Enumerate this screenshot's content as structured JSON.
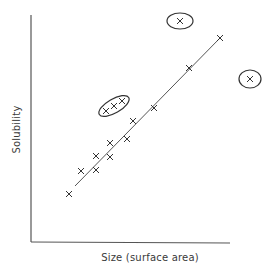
{
  "chart_data": {
    "type": "scatter",
    "title": "",
    "xlabel": "Size (surface area)",
    "ylabel": "Solubility",
    "grid": false,
    "legend": null,
    "axis_ticks": "none",
    "series": [
      {
        "name": "on-trend compounds",
        "marker": "x",
        "points": [
          [
            69,
            194
          ],
          [
            81,
            171
          ],
          [
            96,
            170
          ],
          [
            96,
            156
          ],
          [
            110,
            157
          ],
          [
            110,
            143
          ],
          [
            127,
            139
          ],
          [
            133,
            121
          ],
          [
            154,
            108
          ],
          [
            189,
            68
          ],
          [
            220,
            38
          ]
        ]
      },
      {
        "name": "circled cluster (above trend)",
        "marker": "x",
        "enclosed": true,
        "points": [
          [
            106,
            111
          ],
          [
            114,
            106
          ],
          [
            122,
            101
          ]
        ]
      },
      {
        "name": "circled outlier (high solubility)",
        "marker": "x",
        "enclosed": true,
        "points": [
          [
            180,
            21
          ]
        ]
      },
      {
        "name": "circled outlier (right of trend)",
        "marker": "x",
        "enclosed": true,
        "points": [
          [
            250,
            79
          ]
        ]
      }
    ],
    "trend_line": {
      "from": [
        75,
        186
      ],
      "to": [
        220,
        38
      ]
    },
    "annotations": [
      "Ellipse around three-point cluster above line",
      "Ellipse around top outlier",
      "Ellipse around right outlier"
    ]
  },
  "labels": {
    "x": "Size (surface area)",
    "y": "Solubility"
  },
  "colors": {
    "ink": "#3a3a3a",
    "background": "#ffffff"
  }
}
